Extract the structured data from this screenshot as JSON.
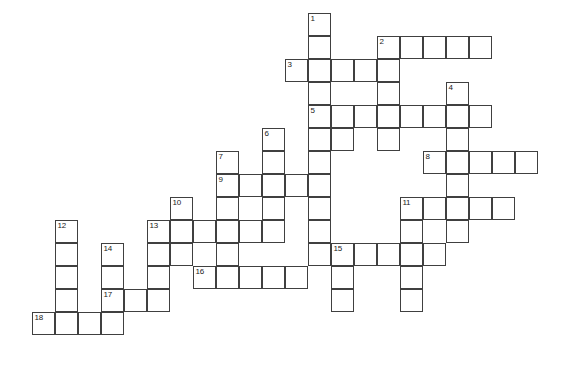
{
  "puzzle": {
    "type": "crossword-grid",
    "title": "",
    "cell_size": 23,
    "origin": {
      "x": 9,
      "y": 13
    },
    "colors": {
      "cell_fill": "#ffffff",
      "cell_border": "#404040",
      "number_text": "#1a1a1a",
      "page_background": "#ffffff"
    },
    "grid_dimensions": {
      "columns": 24,
      "rows": 16
    },
    "cells": [
      {
        "col": 13,
        "row": 0,
        "number": "1"
      },
      {
        "col": 13,
        "row": 1,
        "number": ""
      },
      {
        "col": 16,
        "row": 1,
        "number": "2"
      },
      {
        "col": 17,
        "row": 1,
        "number": ""
      },
      {
        "col": 18,
        "row": 1,
        "number": ""
      },
      {
        "col": 19,
        "row": 1,
        "number": ""
      },
      {
        "col": 20,
        "row": 1,
        "number": ""
      },
      {
        "col": 12,
        "row": 2,
        "number": "3"
      },
      {
        "col": 13,
        "row": 2,
        "number": ""
      },
      {
        "col": 14,
        "row": 2,
        "number": ""
      },
      {
        "col": 15,
        "row": 2,
        "number": ""
      },
      {
        "col": 16,
        "row": 2,
        "number": ""
      },
      {
        "col": 13,
        "row": 3,
        "number": ""
      },
      {
        "col": 16,
        "row": 3,
        "number": ""
      },
      {
        "col": 19,
        "row": 3,
        "number": "4"
      },
      {
        "col": 13,
        "row": 4,
        "number": "5"
      },
      {
        "col": 14,
        "row": 4,
        "number": ""
      },
      {
        "col": 15,
        "row": 4,
        "number": ""
      },
      {
        "col": 16,
        "row": 4,
        "number": ""
      },
      {
        "col": 17,
        "row": 4,
        "number": ""
      },
      {
        "col": 18,
        "row": 4,
        "number": ""
      },
      {
        "col": 19,
        "row": 4,
        "number": ""
      },
      {
        "col": 20,
        "row": 4,
        "number": ""
      },
      {
        "col": 13,
        "row": 5,
        "number": ""
      },
      {
        "col": 14,
        "row": 5,
        "number": ""
      },
      {
        "col": 16,
        "row": 5,
        "number": ""
      },
      {
        "col": 19,
        "row": 5,
        "number": ""
      },
      {
        "col": 11,
        "row": 5,
        "number": "6"
      },
      {
        "col": 13,
        "row": 6,
        "number": ""
      },
      {
        "col": 11,
        "row": 6,
        "number": ""
      },
      {
        "col": 18,
        "row": 6,
        "number": "8"
      },
      {
        "col": 19,
        "row": 6,
        "number": ""
      },
      {
        "col": 20,
        "row": 6,
        "number": ""
      },
      {
        "col": 21,
        "row": 6,
        "number": ""
      },
      {
        "col": 22,
        "row": 6,
        "number": ""
      },
      {
        "col": 9,
        "row": 6,
        "number": "7"
      },
      {
        "col": 9,
        "row": 7,
        "number": "9"
      },
      {
        "col": 10,
        "row": 7,
        "number": ""
      },
      {
        "col": 11,
        "row": 7,
        "number": ""
      },
      {
        "col": 12,
        "row": 7,
        "number": ""
      },
      {
        "col": 13,
        "row": 7,
        "number": ""
      },
      {
        "col": 19,
        "row": 7,
        "number": ""
      },
      {
        "col": 9,
        "row": 8,
        "number": ""
      },
      {
        "col": 11,
        "row": 8,
        "number": ""
      },
      {
        "col": 13,
        "row": 8,
        "number": ""
      },
      {
        "col": 19,
        "row": 8,
        "number": ""
      },
      {
        "col": 7,
        "row": 8,
        "number": "10"
      },
      {
        "col": 17,
        "row": 8,
        "number": "11"
      },
      {
        "col": 18,
        "row": 8,
        "number": ""
      },
      {
        "col": 19,
        "row": 8,
        "number": ""
      },
      {
        "col": 20,
        "row": 8,
        "number": ""
      },
      {
        "col": 21,
        "row": 8,
        "number": ""
      },
      {
        "col": 6,
        "row": 9,
        "number": "13"
      },
      {
        "col": 7,
        "row": 9,
        "number": ""
      },
      {
        "col": 8,
        "row": 9,
        "number": ""
      },
      {
        "col": 9,
        "row": 9,
        "number": ""
      },
      {
        "col": 10,
        "row": 9,
        "number": ""
      },
      {
        "col": 11,
        "row": 9,
        "number": ""
      },
      {
        "col": 13,
        "row": 9,
        "number": ""
      },
      {
        "col": 17,
        "row": 9,
        "number": ""
      },
      {
        "col": 2,
        "row": 9,
        "number": "12"
      },
      {
        "col": 19,
        "row": 9,
        "number": ""
      },
      {
        "col": 2,
        "row": 10,
        "number": ""
      },
      {
        "col": 4,
        "row": 10,
        "number": "14"
      },
      {
        "col": 6,
        "row": 10,
        "number": ""
      },
      {
        "col": 7,
        "row": 10,
        "number": ""
      },
      {
        "col": 9,
        "row": 10,
        "number": ""
      },
      {
        "col": 13,
        "row": 10,
        "number": ""
      },
      {
        "col": 14,
        "row": 10,
        "number": "15"
      },
      {
        "col": 15,
        "row": 10,
        "number": ""
      },
      {
        "col": 16,
        "row": 10,
        "number": ""
      },
      {
        "col": 17,
        "row": 10,
        "number": ""
      },
      {
        "col": 18,
        "row": 10,
        "number": ""
      },
      {
        "col": 2,
        "row": 11,
        "number": ""
      },
      {
        "col": 4,
        "row": 11,
        "number": ""
      },
      {
        "col": 6,
        "row": 11,
        "number": ""
      },
      {
        "col": 8,
        "row": 11,
        "number": "16"
      },
      {
        "col": 9,
        "row": 11,
        "number": ""
      },
      {
        "col": 10,
        "row": 11,
        "number": ""
      },
      {
        "col": 11,
        "row": 11,
        "number": ""
      },
      {
        "col": 12,
        "row": 11,
        "number": ""
      },
      {
        "col": 14,
        "row": 11,
        "number": ""
      },
      {
        "col": 17,
        "row": 11,
        "number": ""
      },
      {
        "col": 2,
        "row": 12,
        "number": ""
      },
      {
        "col": 4,
        "row": 12,
        "number": "17"
      },
      {
        "col": 5,
        "row": 12,
        "number": ""
      },
      {
        "col": 6,
        "row": 12,
        "number": ""
      },
      {
        "col": 14,
        "row": 12,
        "number": ""
      },
      {
        "col": 17,
        "row": 12,
        "number": ""
      },
      {
        "col": 1,
        "row": 13,
        "number": "18"
      },
      {
        "col": 2,
        "row": 13,
        "number": ""
      },
      {
        "col": 3,
        "row": 13,
        "number": ""
      },
      {
        "col": 4,
        "row": 13,
        "number": ""
      }
    ]
  }
}
